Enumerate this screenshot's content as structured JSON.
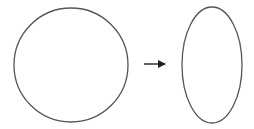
{
  "diagram": {
    "background": "#ffffff",
    "stroke_color": "#555555",
    "arrow_color": "#222222",
    "circle": {
      "cx": 71,
      "cy": 65,
      "r": 57
    },
    "arrow": {
      "x1": 144,
      "y1": 64,
      "x2": 165,
      "y2": 64
    },
    "ellipse": {
      "cx": 212,
      "cy": 65,
      "rx": 30,
      "ry": 58
    }
  }
}
